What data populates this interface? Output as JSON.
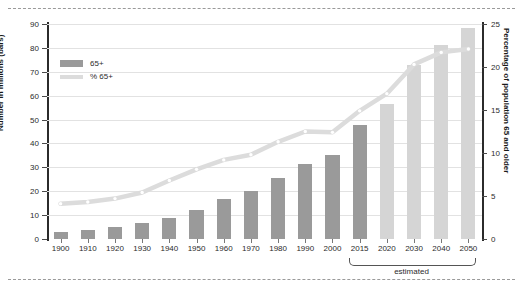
{
  "chart_data": {
    "type": "bar",
    "title": "",
    "subtitle": "",
    "xlabel": "",
    "ylabel": "Number in millions (bars)",
    "ylabel_right": "Percentage of population 65 and older",
    "categories": [
      "1900",
      "1910",
      "1920",
      "1930",
      "1940",
      "1950",
      "1960",
      "1970",
      "1980",
      "1990",
      "2000",
      "2015",
      "2020",
      "2030",
      "2040",
      "2050"
    ],
    "ylim": [
      0,
      90
    ],
    "ylim_right": [
      0,
      25
    ],
    "yticks": [
      0,
      10,
      20,
      30,
      40,
      50,
      60,
      70,
      80,
      90
    ],
    "yticks_right": [
      0,
      5,
      10,
      15,
      20,
      25
    ],
    "grid": true,
    "legend_position": "upper-left",
    "series": [
      {
        "name": "65+",
        "type": "bar",
        "axis": "left",
        "unit": "millions",
        "values": [
          3.1,
          3.9,
          4.9,
          6.6,
          9.0,
          12.3,
          16.6,
          20.1,
          25.5,
          31.2,
          35.0,
          47.8,
          56.4,
          72.8,
          81.2,
          88.5
        ],
        "color_actual": "#9a9a9a",
        "color_projected": "#d5d5d5",
        "projected_from": "2020"
      },
      {
        "name": "% 65+",
        "type": "line",
        "axis": "right",
        "unit": "percent",
        "values": [
          4.1,
          4.3,
          4.7,
          5.4,
          6.8,
          8.1,
          9.2,
          9.8,
          11.3,
          12.5,
          12.4,
          14.9,
          16.9,
          20.3,
          21.7,
          22.1
        ],
        "color": "#dcdcdc",
        "marker": "circle"
      }
    ],
    "annotations": [
      {
        "name": "estimated-bracket",
        "text": "estimated",
        "covers": [
          "2020",
          "2030",
          "2040",
          "2050"
        ]
      }
    ]
  },
  "legend": {
    "items": [
      {
        "label": "65+",
        "marker": "bar-swatch"
      },
      {
        "label": "% 65+",
        "marker": "line-swatch"
      }
    ]
  },
  "axes": {
    "left_title": "Number in millions (bars)",
    "right_title": "Percentage of population 65 and older",
    "left_ticks": [
      "0",
      "10",
      "20",
      "30",
      "40",
      "50",
      "60",
      "70",
      "80",
      "90"
    ],
    "right_ticks": [
      "0",
      "5",
      "10",
      "15",
      "20",
      "25"
    ],
    "x_ticks": [
      "1900",
      "1910",
      "1920",
      "1930",
      "1940",
      "1950",
      "1960",
      "1970",
      "1980",
      "1990",
      "2000",
      "2015",
      "2020",
      "2030",
      "2040",
      "2050"
    ]
  },
  "annotation": {
    "estimated_label": "estimated"
  },
  "colors": {
    "bar_actual": "#9a9a9a",
    "bar_projected": "#d5d5d5",
    "line": "#dcdcdc",
    "grid": "#e2e2e2",
    "axis": "#2b2b2b",
    "rule": "#9a9a9a"
  }
}
